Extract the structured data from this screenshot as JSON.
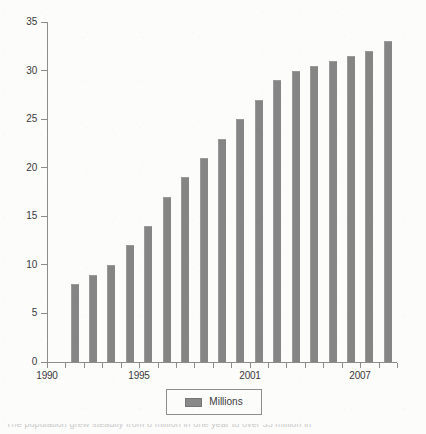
{
  "chart_data": {
    "type": "bar",
    "title": "",
    "subtitle": "",
    "xlabel": "",
    "ylabel": "",
    "ylim": [
      0,
      35
    ],
    "ytick_values": [
      0,
      5,
      10,
      15,
      20,
      25,
      30,
      35
    ],
    "ytick_labels": [
      "0",
      "5",
      "10",
      "15",
      "20",
      "25",
      "30",
      "35"
    ],
    "xlim": [
      1990,
      2009
    ],
    "xtick_values": [
      1990,
      1991,
      1992,
      1993,
      1994,
      1995,
      1996,
      1997,
      1998,
      1999,
      2000,
      2001,
      2002,
      2003,
      2004,
      2005,
      2006,
      2007,
      2008,
      2009
    ],
    "xtick_labels_shown": [
      "1990",
      "1995",
      "2001",
      "2007"
    ],
    "xtick_label_values": [
      1990,
      1995,
      2001,
      2007
    ],
    "grid": false,
    "legend_position": "bottom-center",
    "categories": [
      1991,
      1992,
      1993,
      1994,
      1995,
      1996,
      1997,
      1998,
      1999,
      2000,
      2001,
      2002,
      2003,
      2004,
      2005,
      2006,
      2007,
      2008
    ],
    "series": [
      {
        "name": "Millions",
        "color": "#858585",
        "values": [
          8,
          9,
          10,
          12,
          14,
          17,
          19,
          21,
          23,
          25,
          27,
          29,
          30,
          30.5,
          31,
          31.5,
          32,
          33
        ]
      }
    ],
    "annotations": []
  },
  "legend": {
    "entries": [
      {
        "label": "Millions",
        "swatch_name": "legend-swatch-millions"
      }
    ]
  },
  "colors": {
    "bar_fill": "#858585",
    "bar_edge": "#9a9a9a",
    "axis": "#8d8d8d",
    "text": "#3a3a3a",
    "background": "#fcfcfb"
  },
  "caption": {
    "text": "The population grew steadily from 8 million in one year to over 33 million in"
  }
}
